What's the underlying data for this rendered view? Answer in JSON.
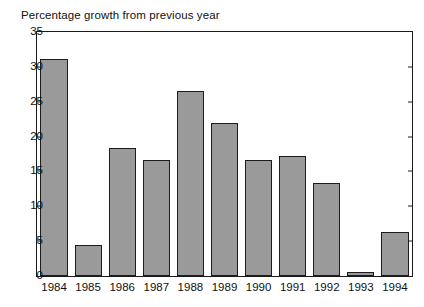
{
  "chart_data": {
    "type": "bar",
    "title": "Percentage growth from previous year",
    "xlabel": "",
    "ylabel": "",
    "categories": [
      "1984",
      "1985",
      "1986",
      "1987",
      "1988",
      "1989",
      "1990",
      "1991",
      "1992",
      "1993",
      "1994"
    ],
    "values": [
      31.1,
      4.4,
      18.4,
      16.7,
      26.6,
      21.9,
      16.7,
      17.2,
      13.3,
      0.6,
      6.3
    ],
    "ylim": [
      0,
      35
    ],
    "ytick_labels": [
      "0",
      "5",
      "10",
      "15",
      "20",
      "25",
      "30",
      "35"
    ],
    "ytick_values": [
      0,
      5,
      10,
      15,
      20,
      25,
      30,
      35
    ],
    "grid": false,
    "legend": false,
    "legend_position": "none",
    "bar_color": "#9a9a9a",
    "bar_edge_color": "#1c1c1c",
    "axis_color": "#1a1a1a",
    "background_color": "#ffffff",
    "tick_direction": "in",
    "frame": "full-rectangle"
  }
}
